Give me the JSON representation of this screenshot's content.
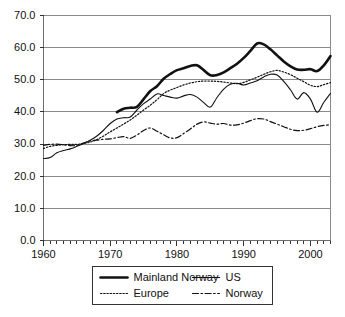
{
  "chart_data": {
    "type": "line",
    "title": "",
    "subtitle": "",
    "xlabel": "",
    "ylabel": "",
    "xlim": [
      1960,
      2003
    ],
    "ylim": [
      0,
      70
    ],
    "grid": true,
    "legend_position": "bottom",
    "y_ticks": [
      "0.0",
      "10.0",
      "20.0",
      "30.0",
      "40.0",
      "50.0",
      "60.0",
      "70.0"
    ],
    "y_tick_values": [
      0,
      10,
      20,
      30,
      40,
      50,
      60,
      70
    ],
    "x_ticks": [
      "1960",
      "1970",
      "1980",
      "1990",
      "2000"
    ],
    "x_tick_values": [
      1960,
      1970,
      1980,
      1990,
      2000
    ],
    "x_minor_tick_step": 1,
    "series": [
      {
        "name": "Mainland Norway",
        "style": "solid-thick",
        "color": "#111111",
        "x": [
          1971,
          1972,
          1973,
          1974,
          1975,
          1976,
          1977,
          1978,
          1979,
          1980,
          1981,
          1982,
          1983,
          1984,
          1985,
          1986,
          1987,
          1988,
          1989,
          1990,
          1991,
          1992,
          1993,
          1994,
          1995,
          1996,
          1997,
          1998,
          1999,
          2000,
          2001,
          2002,
          2003
        ],
        "values": [
          39.9,
          41.0,
          41.3,
          41.6,
          44.0,
          46.5,
          48.0,
          50.3,
          51.8,
          53.0,
          53.6,
          54.3,
          54.5,
          53.0,
          51.4,
          51.5,
          52.3,
          53.6,
          55.0,
          56.8,
          59.0,
          61.3,
          61.0,
          59.5,
          57.6,
          55.7,
          54.2,
          53.2,
          53.1,
          53.3,
          52.7,
          54.5,
          57.4
        ]
      },
      {
        "name": "US",
        "style": "solid-thin",
        "color": "#111111",
        "x": [
          1960,
          1961,
          1962,
          1963,
          1964,
          1965,
          1966,
          1967,
          1968,
          1969,
          1970,
          1971,
          1972,
          1973,
          1974,
          1975,
          1976,
          1977,
          1978,
          1979,
          1980,
          1981,
          1982,
          1983,
          1984,
          1985,
          1986,
          1987,
          1988,
          1989,
          1990,
          1991,
          1992,
          1993,
          1994,
          1995,
          1996,
          1997,
          1998,
          1999,
          2000,
          2001,
          2002,
          2003
        ],
        "values": [
          25.5,
          25.8,
          27.3,
          28.0,
          28.5,
          29.3,
          30.2,
          31.2,
          32.5,
          34.3,
          36.4,
          37.8,
          38.2,
          38.4,
          40.6,
          42.6,
          44.0,
          45.6,
          45.1,
          44.6,
          44.3,
          45.0,
          45.4,
          44.6,
          42.9,
          41.5,
          44.5,
          47.1,
          48.6,
          48.9,
          48.4,
          49.0,
          49.7,
          50.9,
          51.7,
          51.5,
          49.5,
          46.9,
          44.0,
          46.0,
          44.0,
          39.9,
          43.0,
          45.8
        ]
      },
      {
        "name": "Europe",
        "style": "dotted",
        "color": "#111111",
        "x": [
          1960,
          1961,
          1962,
          1963,
          1964,
          1965,
          1966,
          1967,
          1968,
          1969,
          1970,
          1971,
          1972,
          1973,
          1974,
          1975,
          1976,
          1977,
          1978,
          1979,
          1980,
          1981,
          1982,
          1983,
          1984,
          1985,
          1986,
          1987,
          1988,
          1989,
          1990,
          1991,
          1992,
          1993,
          1994,
          1995,
          1996,
          1997,
          1998,
          1999,
          2000,
          2001,
          2002,
          2003
        ],
        "values": [
          28.6,
          29.3,
          29.6,
          29.8,
          29.9,
          29.9,
          30.2,
          30.6,
          31.4,
          32.5,
          33.8,
          35.0,
          36.2,
          37.5,
          39.0,
          40.6,
          42.1,
          43.8,
          45.7,
          46.8,
          47.6,
          48.4,
          49.0,
          49.4,
          49.6,
          49.6,
          49.5,
          49.3,
          49.0,
          48.8,
          49.2,
          50.0,
          50.8,
          51.7,
          52.5,
          52.9,
          52.4,
          51.6,
          50.5,
          49.4,
          48.3,
          47.9,
          48.5,
          49.1
        ]
      },
      {
        "name": "Norway",
        "style": "dash-dot",
        "color": "#111111",
        "x": [
          1960,
          1961,
          1962,
          1963,
          1964,
          1965,
          1966,
          1967,
          1968,
          1969,
          1970,
          1971,
          1972,
          1973,
          1974,
          1975,
          1976,
          1977,
          1978,
          1979,
          1980,
          1981,
          1982,
          1983,
          1984,
          1985,
          1986,
          1987,
          1988,
          1989,
          1990,
          1991,
          1992,
          1993,
          1994,
          1995,
          1996,
          1997,
          1998,
          1999,
          2000,
          2001,
          2002,
          2003
        ],
        "values": [
          29.6,
          29.9,
          30.0,
          29.8,
          29.5,
          29.6,
          30.3,
          31.0,
          31.2,
          31.5,
          31.6,
          32.0,
          32.3,
          31.8,
          32.8,
          34.2,
          35.0,
          34.0,
          32.9,
          31.9,
          32.0,
          33.3,
          34.7,
          36.2,
          36.9,
          36.5,
          36.2,
          36.4,
          35.9,
          36.0,
          36.5,
          37.3,
          37.9,
          37.8,
          37.0,
          36.2,
          35.4,
          34.6,
          34.2,
          34.3,
          34.8,
          35.4,
          35.8,
          36.0
        ]
      }
    ]
  },
  "legend": {
    "entries": [
      {
        "label": "Mainland Norway",
        "style": "solid-thick"
      },
      {
        "label": "US",
        "style": "solid-thin"
      },
      {
        "label": "Europe",
        "style": "dotted"
      },
      {
        "label": "Norway",
        "style": "dash-dot"
      }
    ]
  },
  "colors": {
    "ink": "#111111",
    "grid": "#8a8a8a",
    "background": "#ffffff"
  }
}
